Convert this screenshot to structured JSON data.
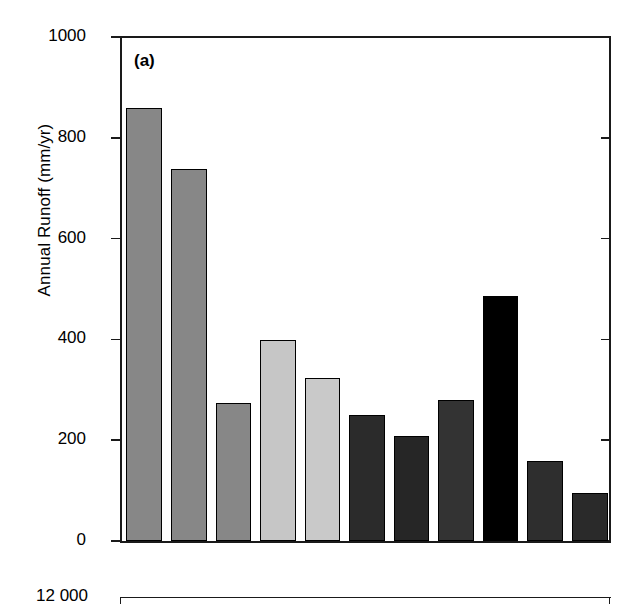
{
  "figure": {
    "background": "#ffffff",
    "axis_color": "#1a1a1a"
  },
  "chart_data": {
    "type": "bar",
    "title": "(a)",
    "xlabel": "",
    "ylabel": "Annual Runoff (mm/yr)",
    "ylim": [
      0,
      1000
    ],
    "yticks": [
      0,
      200,
      400,
      600,
      800,
      1000
    ],
    "ytick_labels": [
      "0",
      "200",
      "400",
      "600",
      "800",
      "1000"
    ],
    "grid": false,
    "legend": "none",
    "categories": [
      "1",
      "2",
      "3",
      "4",
      "5",
      "6",
      "7",
      "8",
      "9",
      "10",
      "11"
    ],
    "values": [
      860,
      738,
      274,
      399,
      323,
      250,
      209,
      279,
      487,
      159,
      96
    ],
    "bar_colors": [
      "#878787",
      "#878787",
      "#878787",
      "#c6c6c6",
      "#c9c9c9",
      "#2b2b2b",
      "#262626",
      "#333333",
      "#000000",
      "#2e2e2e",
      "#2a2a2a"
    ],
    "bar_edge_color": "#000000"
  },
  "panel_b": {
    "ytick_label_top": "12 000",
    "note": "second panel cropped at image bottom edge"
  }
}
